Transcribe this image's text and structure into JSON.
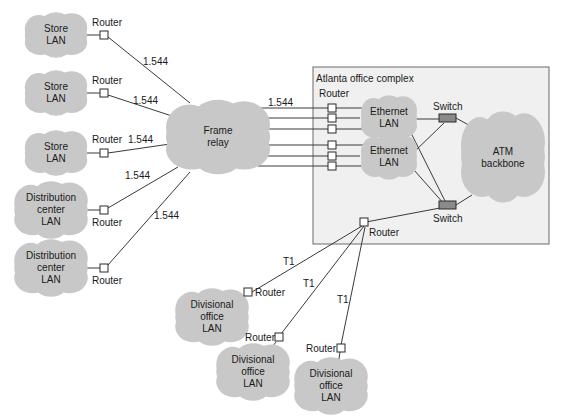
{
  "complex": {
    "title": "Atlanta office complex"
  },
  "labels": {
    "router": "Router",
    "switch": "Switch",
    "speed_frame": "1.544",
    "speed_t1": "T1"
  },
  "clouds": {
    "store1": "Store\nLAN",
    "store2": "Store\nLAN",
    "store3": "Store\nLAN",
    "dist1": "Distribution\ncenter\nLAN",
    "dist2": "Distribution\ncenter\nLAN",
    "frame_relay": "Frame\nrelay",
    "ethernet1": "Ethernet\nLAN",
    "ethernet2": "Ethernet\nLAN",
    "atm": "ATM\nbackbone",
    "div1": "Divisional\noffice\nLAN",
    "div2": "Divisional\noffice\nLAN",
    "div3": "Divisional\noffice\nLAN"
  },
  "links": [
    {
      "from": "store1-router",
      "to": "frame-relay",
      "speed": "1.544"
    },
    {
      "from": "store2-router",
      "to": "frame-relay",
      "speed": "1.544"
    },
    {
      "from": "store3-router",
      "to": "frame-relay",
      "speed": "1.544"
    },
    {
      "from": "dist1-router",
      "to": "frame-relay",
      "speed": "1.544"
    },
    {
      "from": "dist2-router",
      "to": "frame-relay",
      "speed": "1.544"
    },
    {
      "from": "frame-relay",
      "to": "atlanta-routers",
      "speed": "1.544"
    },
    {
      "from": "atlanta-router",
      "to": "div1-router",
      "speed": "T1"
    },
    {
      "from": "atlanta-router",
      "to": "div2-router",
      "speed": "T1"
    },
    {
      "from": "atlanta-router",
      "to": "div3-router",
      "speed": "T1"
    }
  ],
  "colors": {
    "cloud": "#c8c8c8",
    "complex_fill": "#f0f0f0",
    "complex_border": "#6a6a6a",
    "line": "#3a3a3a",
    "switch_fill": "#8a8a8a"
  }
}
